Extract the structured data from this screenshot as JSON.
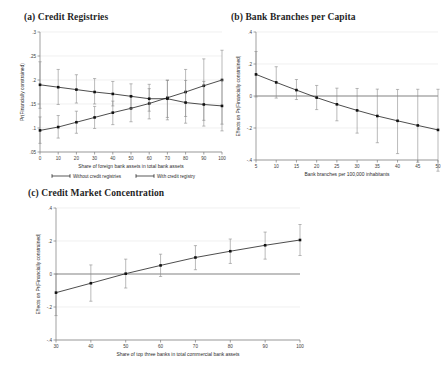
{
  "figure": {
    "background": "#ffffff",
    "series_color": "#111111",
    "errorbar_color": "#8b8b8b",
    "grid_color": "#e9e9e9"
  },
  "panels": [
    {
      "id": "a",
      "title": "(a) Credit Registries",
      "xlabel": "Share of foreign bank assets in total bank assets",
      "ylabel": "Pr(Financially constrained)",
      "legend": [
        {
          "label": "Without credit registries"
        },
        {
          "label": "With credit registry"
        }
      ]
    },
    {
      "id": "b",
      "title": "(b) Bank Branches per Capita",
      "xlabel": "Bank branches per 100,000 inhabitants",
      "ylabel": "Effects on Pr(Financially constrained)"
    },
    {
      "id": "c",
      "title": "(c) Credit Market Concentration",
      "xlabel": "Share of top three banks in total commercial bank assets",
      "ylabel": "Effects on Pr(Financially constrained)"
    }
  ],
  "chart_data": [
    {
      "type": "line",
      "panel": "a",
      "title": "(a) Credit Registries",
      "xlabel": "Share of foreign bank assets in total bank assets",
      "ylabel": "Pr(Financially constrained)",
      "xlim": [
        0,
        100
      ],
      "ylim": [
        0.05,
        0.3
      ],
      "xticks": [
        0,
        10,
        20,
        30,
        40,
        50,
        60,
        70,
        80,
        90,
        100
      ],
      "xticklabels": [
        "0",
        "10",
        "20",
        "30",
        "40",
        "50",
        "60",
        "70",
        "80",
        "90",
        "100"
      ],
      "yticks": [
        0.05,
        0.1,
        0.15,
        0.2,
        0.25,
        0.3
      ],
      "yticklabels": [
        ".05",
        ".1",
        ".15",
        ".2",
        ".25",
        ".3"
      ],
      "grid": true,
      "legend_position": "below",
      "x": [
        0,
        10,
        20,
        30,
        40,
        50,
        60,
        70,
        80,
        90,
        100
      ],
      "series": [
        {
          "name": "Without credit registries",
          "values": [
            0.095,
            0.102,
            0.112,
            0.122,
            0.132,
            0.141,
            0.151,
            0.163,
            0.175,
            0.188,
            0.2
          ],
          "ci_low": [
            0.068,
            0.079,
            0.089,
            0.099,
            0.107,
            0.113,
            0.119,
            0.122,
            0.124,
            0.116,
            0.108
          ],
          "ci_high": [
            0.123,
            0.126,
            0.135,
            0.145,
            0.156,
            0.168,
            0.182,
            0.2,
            0.222,
            0.244,
            0.262
          ]
        },
        {
          "name": "With credit registry",
          "values": [
            0.19,
            0.185,
            0.18,
            0.175,
            0.171,
            0.166,
            0.161,
            0.161,
            0.153,
            0.149,
            0.146
          ],
          "ci_low": [
            0.141,
            0.149,
            0.152,
            0.15,
            0.146,
            0.141,
            0.135,
            0.117,
            0.11,
            0.104,
            0.094
          ],
          "ci_high": [
            0.238,
            0.222,
            0.211,
            0.203,
            0.197,
            0.192,
            0.191,
            0.199,
            0.199,
            0.197,
            0.2
          ]
        }
      ]
    },
    {
      "type": "line",
      "panel": "b",
      "title": "(b) Bank Branches per Capita",
      "xlabel": "Bank branches per 100,000 inhabitants",
      "ylabel": "Effects on Pr(Financially constrained)",
      "xlim": [
        5,
        50
      ],
      "ylim": [
        -0.4,
        0.4
      ],
      "xticks": [
        5,
        10,
        15,
        20,
        25,
        30,
        35,
        40,
        45,
        50
      ],
      "xticklabels": [
        "5",
        "10",
        "15",
        "20",
        "25",
        "30",
        "35",
        "40",
        "45",
        "50"
      ],
      "yticks": [
        -0.4,
        -0.2,
        0,
        0.2,
        0.4
      ],
      "yticklabels": [
        "-.4",
        "-.2",
        "0",
        ".2",
        ".4"
      ],
      "grid": true,
      "zero_line": 0,
      "x": [
        5,
        10,
        15,
        20,
        25,
        30,
        35,
        40,
        45,
        50
      ],
      "series": [
        {
          "name": "Effect",
          "values": [
            0.135,
            0.085,
            0.037,
            -0.01,
            -0.052,
            -0.09,
            -0.125,
            -0.155,
            -0.184,
            -0.212
          ],
          "ci_low": [
            -0.006,
            -0.013,
            -0.022,
            -0.085,
            -0.155,
            -0.232,
            -0.292,
            -0.36,
            -0.414,
            -0.47
          ],
          "ci_high": [
            0.278,
            0.183,
            0.103,
            0.066,
            0.049,
            0.047,
            0.043,
            0.041,
            0.042,
            0.042
          ]
        }
      ]
    },
    {
      "type": "line",
      "panel": "c",
      "title": "(c) Credit Market Concentration",
      "xlabel": "Share of top three banks in total commercial bank assets",
      "ylabel": "Effects on Pr(Financially constrained)",
      "xlim": [
        30,
        100
      ],
      "ylim": [
        -0.4,
        0.4
      ],
      "xticks": [
        30,
        40,
        50,
        60,
        70,
        80,
        90,
        100
      ],
      "xticklabels": [
        "30",
        "40",
        "50",
        "60",
        "70",
        "80",
        "90",
        "100"
      ],
      "yticks": [
        -0.4,
        -0.2,
        0,
        0.2,
        0.4
      ],
      "yticklabels": [
        "-.4",
        "-.2",
        "0",
        ".2",
        ".4"
      ],
      "grid": true,
      "zero_line": 0,
      "x": [
        30,
        40,
        50,
        60,
        70,
        80,
        90,
        100
      ],
      "series": [
        {
          "name": "Effect",
          "values": [
            -0.113,
            -0.056,
            0.002,
            0.052,
            0.1,
            0.138,
            0.174,
            0.206
          ],
          "ci_low": [
            -0.252,
            -0.165,
            -0.085,
            -0.015,
            0.026,
            0.064,
            0.09,
            0.112
          ],
          "ci_high": [
            0.0,
            0.055,
            0.09,
            0.12,
            0.172,
            0.212,
            0.254,
            0.3
          ]
        }
      ]
    }
  ]
}
